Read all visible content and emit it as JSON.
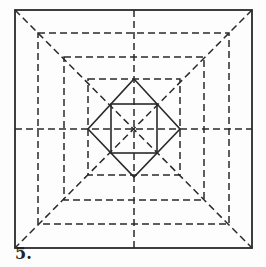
{
  "figure": {
    "label": "5.",
    "colors": {
      "line": "#2a2a2a",
      "background": "#fdfdfd"
    }
  }
}
